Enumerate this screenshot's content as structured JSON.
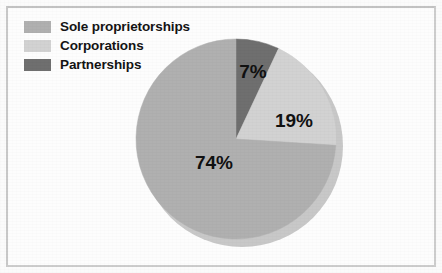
{
  "figure": {
    "background_color": "#fbfbfb",
    "frame_color": "#cdcdcd"
  },
  "legend": {
    "position": "top-left",
    "items": [
      {
        "label": "Sole proprietorships",
        "color": "#b0b0b0",
        "swatch_name": "legend-swatch-sole-proprietorships"
      },
      {
        "label": "Corporations",
        "color": "#d2d2d2",
        "swatch_name": "legend-swatch-corporations"
      },
      {
        "label": "Partnerships",
        "color": "#6f6f6f",
        "swatch_name": "legend-swatch-partnerships"
      }
    ]
  },
  "chart_data": {
    "type": "pie",
    "title": "",
    "subtitle": "",
    "xlabel": "",
    "ylabel": "",
    "grid": false,
    "legend_position": "top-left",
    "start_angle_deg": 0,
    "direction": "clockwise",
    "center": {
      "x": 236,
      "y": 139
    },
    "radius": 100,
    "depth_3d": true,
    "categories": [
      "Partnerships",
      "Corporations",
      "Sole proprietorships"
    ],
    "values": [
      7,
      19,
      74
    ],
    "unit": "%",
    "data_labels": [
      "7%",
      "19%",
      "74%"
    ],
    "colors": [
      "#6f6f6f",
      "#d2d2d2",
      "#b0b0b0"
    ],
    "slices": [
      {
        "name": "Partnerships",
        "value": 7,
        "label": "7%",
        "color": "#6f6f6f",
        "start_deg": 0,
        "end_deg": 25.2,
        "label_x": 253,
        "label_y": 73
      },
      {
        "name": "Corporations",
        "value": 19,
        "label": "19%",
        "color": "#d2d2d2",
        "start_deg": 25.2,
        "end_deg": 93.6,
        "label_x": 294,
        "label_y": 122
      },
      {
        "name": "Sole proprietorships",
        "value": 74,
        "label": "74%",
        "color": "#b0b0b0",
        "start_deg": 93.6,
        "end_deg": 360,
        "label_x": 214,
        "label_y": 164
      }
    ]
  }
}
